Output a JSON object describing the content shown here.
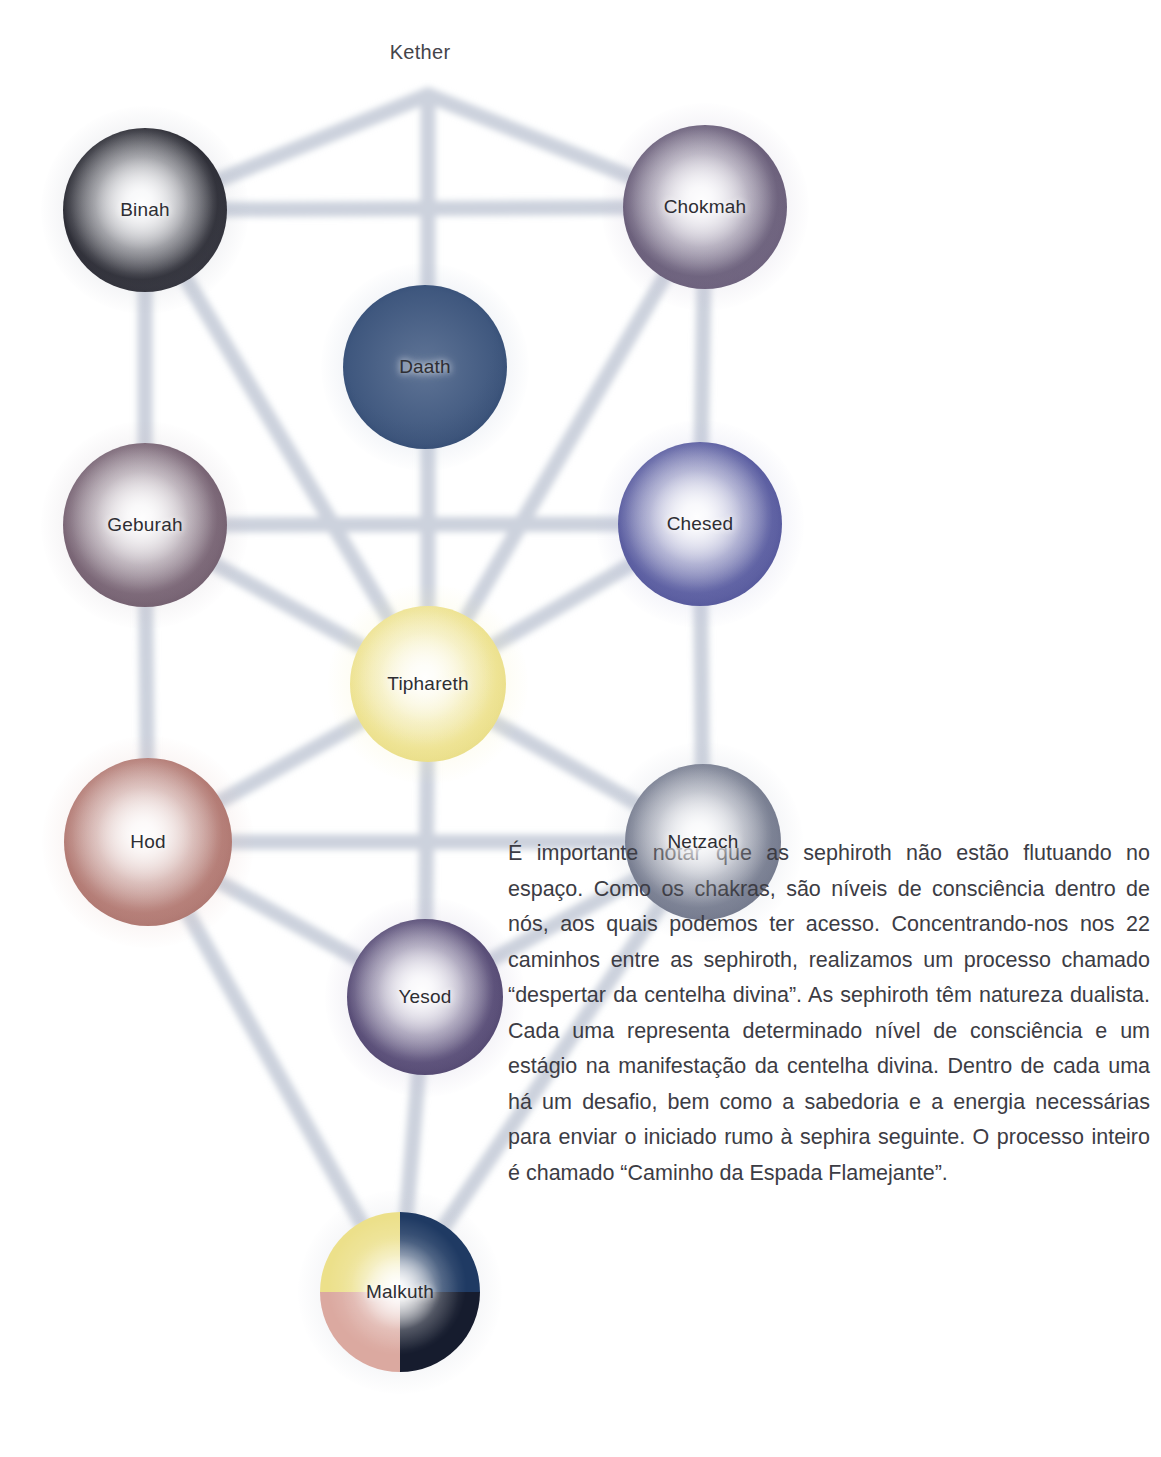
{
  "diagram": {
    "crown_label": "Kether",
    "path_color": "#ccd2dd",
    "sephiroth": [
      {
        "id": "binah",
        "label": "Binah",
        "cx": 145,
        "cy": 210,
        "r": 82,
        "core": "#14141c",
        "rim": "#3a3a46",
        "glow": "#b9bcc8"
      },
      {
        "id": "chokmah",
        "label": "Chokmah",
        "cx": 705,
        "cy": 207,
        "r": 82,
        "core": "#5b4f6b",
        "rim": "#6a5c7a",
        "glow": "#c3bcd2"
      },
      {
        "id": "daath",
        "label": "Daath",
        "cx": 425,
        "cy": 367,
        "r": 82,
        "core": "#25406b",
        "rim": "#1e3760",
        "glow": "#b6c2d6"
      },
      {
        "id": "geburah",
        "label": "Geburah",
        "cx": 145,
        "cy": 525,
        "r": 82,
        "core": "#6b5566",
        "rim": "#5c4859",
        "glow": "#c8bfc8"
      },
      {
        "id": "chesed",
        "label": "Chesed",
        "cx": 700,
        "cy": 524,
        "r": 82,
        "core": "#4a4d96",
        "rim": "#3d4088",
        "glow": "#bcbedf"
      },
      {
        "id": "tiphareth",
        "label": "Tiphareth",
        "cx": 428,
        "cy": 684,
        "r": 78,
        "core": "#ece08a",
        "rim": "#ded06a",
        "glow": "#f6f0bb"
      },
      {
        "id": "hod",
        "label": "Hod",
        "cx": 148,
        "cy": 842,
        "r": 84,
        "core": "#ab6f68",
        "rim": "#9c645e",
        "glow": "#e2c3be"
      },
      {
        "id": "netzach",
        "label": "Netzach",
        "cx": 703,
        "cy": 842,
        "r": 78,
        "core": "#6b7185",
        "rim": "#5a6076",
        "glow": "#c5cad6"
      },
      {
        "id": "yesod",
        "label": "Yesod",
        "cx": 425,
        "cy": 997,
        "r": 78,
        "core": "#463a66",
        "rim": "#3a2f58",
        "glow": "#c0b9d4"
      },
      {
        "id": "malkuth",
        "label": "Malkuth",
        "cx": 400,
        "cy": 1292,
        "r": 80,
        "core": "#000000",
        "rim": "#000000",
        "glow": "#c9cdd8"
      }
    ],
    "malkuth_quadrants": {
      "top": "#ece08a",
      "right": "#1f3a63",
      "bottom": "#161c2e",
      "left": "#dba9a0"
    },
    "paths": [
      {
        "from": "kether",
        "to": "binah"
      },
      {
        "from": "kether",
        "to": "chokmah"
      },
      {
        "from": "kether",
        "to": "tiphareth"
      },
      {
        "from": "binah",
        "to": "chokmah"
      },
      {
        "from": "binah",
        "to": "geburah"
      },
      {
        "from": "binah",
        "to": "tiphareth"
      },
      {
        "from": "chokmah",
        "to": "chesed"
      },
      {
        "from": "chokmah",
        "to": "tiphareth"
      },
      {
        "from": "geburah",
        "to": "chesed"
      },
      {
        "from": "geburah",
        "to": "tiphareth"
      },
      {
        "from": "geburah",
        "to": "hod"
      },
      {
        "from": "chesed",
        "to": "tiphareth"
      },
      {
        "from": "chesed",
        "to": "netzach"
      },
      {
        "from": "tiphareth",
        "to": "hod"
      },
      {
        "from": "tiphareth",
        "to": "netzach"
      },
      {
        "from": "tiphareth",
        "to": "yesod"
      },
      {
        "from": "hod",
        "to": "netzach"
      },
      {
        "from": "hod",
        "to": "yesod"
      },
      {
        "from": "hod",
        "to": "malkuth"
      },
      {
        "from": "netzach",
        "to": "yesod"
      },
      {
        "from": "netzach",
        "to": "malkuth"
      },
      {
        "from": "yesod",
        "to": "malkuth"
      }
    ],
    "path_count": 22
  },
  "body": {
    "text": "É importante notar que as sephiroth não estão flutuando no espaço. Como os chakras, são níveis de consciência dentro de nós, aos quais podemos ter acesso. Concentrando-nos nos 22 caminhos entre as sephiroth, realizamos um processo chamado “despertar da centelha divina”. As sephiroth têm natureza dualista. Cada uma representa determinado nível de consciência e um estágio na manifestação da centelha divina. Dentro de cada uma há um desafio, bem como a sabedoria e a energia necessárias para enviar o iniciado rumo à sephira seguinte. O processo inteiro é chamado “Caminho da Espada Flamejante”."
  }
}
